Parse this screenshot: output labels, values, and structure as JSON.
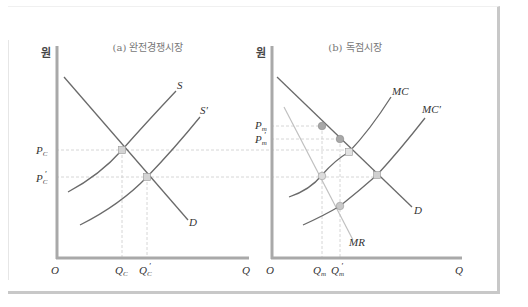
{
  "panels": [
    {
      "id": "a",
      "title": "(a) 완전경쟁시장",
      "y_axis_label": "원",
      "x_axis_label": "Q",
      "origin_label": "O",
      "curves": {
        "demand": "D",
        "supply": "S",
        "supply_shifted": "S′"
      },
      "price_labels": {
        "p1": "P",
        "p1_sub": "C",
        "p2": "P",
        "p2_sub": "C",
        "p2_prime": "′"
      },
      "quantity_labels": {
        "q1": "Q",
        "q1_sub": "C",
        "q2": "Q",
        "q2_sub": "C",
        "q2_prime": "′"
      }
    },
    {
      "id": "b",
      "title": "(b) 독점시장",
      "y_axis_label": "원",
      "x_axis_label": "Q",
      "origin_label": "O",
      "curves": {
        "demand": "D",
        "marginal_revenue": "MR",
        "marginal_cost": "MC",
        "marginal_cost_shifted": "MC′"
      },
      "price_labels": {
        "p1": "P",
        "p1_sub": "m",
        "p2": "P",
        "p2_sub": "m",
        "p2_prime": "′"
      },
      "quantity_labels": {
        "q1": "Q",
        "q1_sub": "m",
        "q2": "Q",
        "q2_sub": "m",
        "q2_prime": "′"
      }
    }
  ],
  "colors": {
    "axis": "#a9a9a9",
    "curve": "#6a6a6a",
    "mr_curve": "#bdbdbd",
    "dashed": "#c9c9c9",
    "point_square": "#d4d4d4",
    "point_circle": "#a8a8a8"
  }
}
